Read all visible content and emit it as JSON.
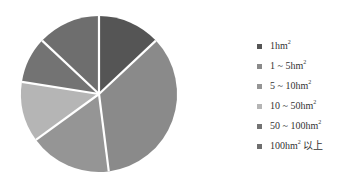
{
  "chart_data": {
    "type": "pie",
    "title": "",
    "start_angle_deg": 0,
    "direction": "clockwise",
    "legend_position": "right",
    "categories": [
      "1hm²",
      "1 ~ 5hm²",
      "5 ~ 10hm²",
      "10 ~ 50hm²",
      "50 ~ 100hm²",
      "100hm² 以上"
    ],
    "values": [
      13,
      35,
      17,
      12.5,
      9.5,
      13
    ],
    "unit": "%",
    "slices": [
      {
        "label_main": "1hm",
        "label_sup": "2",
        "label_suffix": "",
        "value": 13,
        "color": "#555555"
      },
      {
        "label_main": "1 ~ 5hm",
        "label_sup": "2",
        "label_suffix": "",
        "value": 35,
        "color": "#8a8a8a"
      },
      {
        "label_main": "5 ~ 10hm",
        "label_sup": "2",
        "label_suffix": "",
        "value": 17,
        "color": "#959595"
      },
      {
        "label_main": "10 ~ 50hm",
        "label_sup": "2",
        "label_suffix": "",
        "value": 12.5,
        "color": "#b5b5b5"
      },
      {
        "label_main": "50 ~ 100hm",
        "label_sup": "2",
        "label_suffix": "",
        "value": 9.5,
        "color": "#737373"
      },
      {
        "label_main": "100hm",
        "label_sup": "2",
        "label_suffix": " 以上",
        "value": 13,
        "color": "#6e6e6e"
      }
    ],
    "center": [
      99,
      94
    ],
    "radius": 78,
    "separator_color": "#ffffff",
    "separator_width": 2.2
  }
}
